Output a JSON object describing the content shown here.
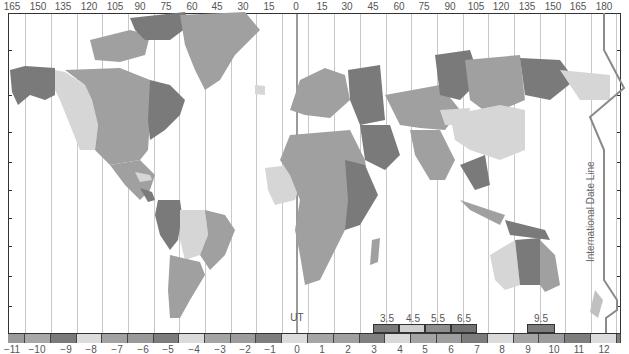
{
  "map": {
    "title_annotation": "International Date Line",
    "ut_label": "UT",
    "longitude_labels": [
      "165",
      "150",
      "135",
      "120",
      "105",
      "90",
      "75",
      "60",
      "45",
      "30",
      "15",
      "0",
      "15",
      "30",
      "45",
      "60",
      "75",
      "90",
      "105",
      "120",
      "135",
      "150",
      "165",
      "180"
    ],
    "zones": [
      {
        "label": "−11",
        "offset": -11,
        "color": "#9a9a9a"
      },
      {
        "label": "−10",
        "offset": -10,
        "color": "#a8a8a8"
      },
      {
        "label": "−9",
        "offset": -9,
        "color": "#7a7a7a"
      },
      {
        "label": "−8",
        "offset": -8,
        "color": "#dcdcdc"
      },
      {
        "label": "−7",
        "offset": -7,
        "color": "#a2a2a2"
      },
      {
        "label": "−6",
        "offset": -6,
        "color": "#999999"
      },
      {
        "label": "−5",
        "offset": -5,
        "color": "#7c7c7c"
      },
      {
        "label": "−4",
        "offset": -4,
        "color": "#dadada"
      },
      {
        "label": "−3",
        "offset": -3,
        "color": "#a4a4a4"
      },
      {
        "label": "−2",
        "offset": -2,
        "color": "#9c9c9c"
      },
      {
        "label": "−1",
        "offset": -1,
        "color": "#7e7e7e"
      },
      {
        "label": "0",
        "offset": 0,
        "color": "#dcdcdc"
      },
      {
        "label": "1",
        "offset": 1,
        "color": "#a6a6a6"
      },
      {
        "label": "2",
        "offset": 2,
        "color": "#a0a0a0"
      },
      {
        "label": "3",
        "offset": 3,
        "color": "#808080"
      },
      {
        "label": "4",
        "offset": 4,
        "color": "#d8d8d8"
      },
      {
        "label": "5",
        "offset": 5,
        "color": "#a4a4a4"
      },
      {
        "label": "6",
        "offset": 6,
        "color": "#9e9e9e"
      },
      {
        "label": "7",
        "offset": 7,
        "color": "#7c7c7c"
      },
      {
        "label": "8",
        "offset": 8,
        "color": "#dadada"
      },
      {
        "label": "9",
        "offset": 9,
        "color": "#a4a4a4"
      },
      {
        "label": "10",
        "offset": 10,
        "color": "#9c9c9c"
      },
      {
        "label": "11",
        "offset": 11,
        "color": "#7e7e7e"
      },
      {
        "label": "12",
        "offset": 12,
        "color": "#dcdcdc"
      }
    ],
    "half_hour_zones": [
      {
        "label": "3.5",
        "color": "#7a7a7a"
      },
      {
        "label": "4.5",
        "color": "#cfcfcf"
      },
      {
        "label": "5.5",
        "color": "#8e8e8e"
      },
      {
        "label": "6.5",
        "color": "#727272"
      },
      {
        "label": "9.5",
        "color": "#7c7c7c"
      }
    ],
    "colors": {
      "frame": "#333333",
      "meridian": "#c8c8c8",
      "date_line": "#8a8a8a",
      "land_dark": "#7a7a7a",
      "land_mid": "#a0a0a0",
      "land_light": "#d6d6d6"
    }
  }
}
